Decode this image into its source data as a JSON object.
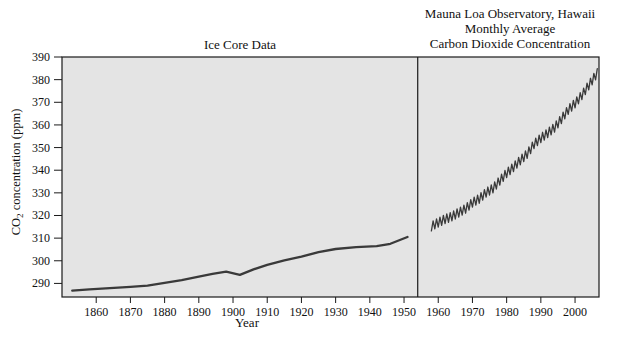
{
  "header": {
    "left_title": "Ice Core Data",
    "right_title_lines": [
      "Mauna Loa Observatory, Hawaii",
      "Monthly Average",
      "Carbon Dioxide Concentration"
    ]
  },
  "axes": {
    "xlabel": "Year",
    "ylabel_prefix": "CO",
    "ylabel_sub": "2",
    "ylabel_rest": " concentration (ppm)"
  },
  "colors": {
    "page_background": "#ffffff",
    "plot_background": "#e4e4e4",
    "axis": "#1a1a1a",
    "series_line": "#3a3a3a",
    "text": "#111111"
  },
  "chart_data": {
    "type": "line",
    "xlabel": "Year",
    "ylabel": "CO2 concentration (ppm)",
    "xlim": [
      1850,
      2007
    ],
    "ylim": [
      284,
      390
    ],
    "xticks": [
      1860,
      1870,
      1880,
      1890,
      1900,
      1910,
      1920,
      1930,
      1940,
      1950,
      1960,
      1970,
      1980,
      1990,
      2000
    ],
    "yticks": [
      290,
      300,
      310,
      320,
      330,
      340,
      350,
      360,
      370,
      380,
      390
    ],
    "grid": false,
    "legend": "none",
    "panel_divider_year": 1954,
    "series": [
      {
        "name": "Ice Core Data",
        "x": [
          1853,
          1858,
          1864,
          1870,
          1875,
          1880,
          1885,
          1890,
          1894,
          1898,
          1902,
          1906,
          1910,
          1915,
          1920,
          1925,
          1930,
          1936,
          1942,
          1946,
          1951
        ],
        "y": [
          286.8,
          287.4,
          287.9,
          288.5,
          289.0,
          290.2,
          291.5,
          293.0,
          294.2,
          295.2,
          293.8,
          296.2,
          298.2,
          300.2,
          301.8,
          303.8,
          305.2,
          306.0,
          306.5,
          307.5,
          310.5
        ]
      },
      {
        "name": "Mauna Loa Observatory, Hawaii Monthly Average",
        "x": [
          1958,
          1960,
          1962,
          1964,
          1966,
          1968,
          1970,
          1972,
          1974,
          1976,
          1978,
          1980,
          1982,
          1984,
          1986,
          1988,
          1990,
          1992,
          1994,
          1996,
          1998,
          2000,
          2002,
          2004,
          2006,
          2006.5
        ],
        "y": [
          315.2,
          316.9,
          318.4,
          319.6,
          321.3,
          323.0,
          325.7,
          327.4,
          330.1,
          332.0,
          335.4,
          338.7,
          341.4,
          344.4,
          347.2,
          351.5,
          354.2,
          356.4,
          358.8,
          362.6,
          366.7,
          369.5,
          373.2,
          377.5,
          381.9,
          382.9
        ],
        "seasonal_amplitude_ppm": 2.0,
        "samples_per_year": 2
      }
    ]
  }
}
